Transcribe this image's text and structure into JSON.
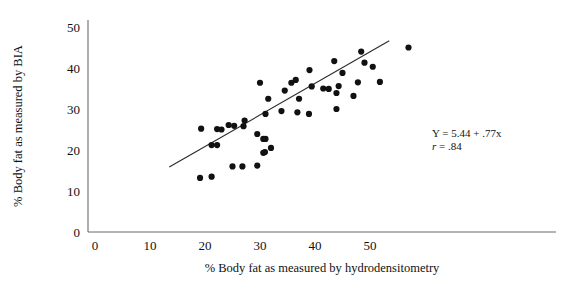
{
  "chart_data": {
    "type": "scatter",
    "title": "",
    "xlabel": "% Body fat as measured by hydrodensitometry",
    "ylabel": "% Body fat as measured by BIA",
    "xlim": [
      0,
      58
    ],
    "ylim": [
      0,
      54
    ],
    "xticks": [
      0,
      10,
      20,
      30,
      40,
      50
    ],
    "yticks": [
      0,
      10,
      20,
      30,
      40,
      50
    ],
    "xticklabels": [
      "0",
      "10",
      "20",
      "30",
      "40",
      "50"
    ],
    "yticklabels": [
      "0",
      "10",
      "20",
      "30",
      "40",
      "50"
    ],
    "grid": false,
    "legend": false,
    "marker": "filled-circle",
    "marker_color": "#111111",
    "points": [
      {
        "x": 19.1,
        "y": 13.2
      },
      {
        "x": 19.3,
        "y": 25.2
      },
      {
        "x": 21.2,
        "y": 21.2
      },
      {
        "x": 21.2,
        "y": 13.5
      },
      {
        "x": 22.2,
        "y": 25.1
      },
      {
        "x": 22.2,
        "y": 21.2
      },
      {
        "x": 23.0,
        "y": 25.0
      },
      {
        "x": 24.3,
        "y": 26.1
      },
      {
        "x": 25.0,
        "y": 16.0
      },
      {
        "x": 25.3,
        "y": 25.9
      },
      {
        "x": 26.8,
        "y": 16.0
      },
      {
        "x": 27.0,
        "y": 25.8
      },
      {
        "x": 29.5,
        "y": 23.9
      },
      {
        "x": 29.5,
        "y": 16.2
      },
      {
        "x": 30.6,
        "y": 22.7
      },
      {
        "x": 31.0,
        "y": 22.7
      },
      {
        "x": 30.6,
        "y": 19.3
      },
      {
        "x": 30.9,
        "y": 19.5
      },
      {
        "x": 36.8,
        "y": 29.2
      },
      {
        "x": 31.0,
        "y": 28.8
      },
      {
        "x": 32.0,
        "y": 20.5
      },
      {
        "x": 39.0,
        "y": 39.5
      },
      {
        "x": 37.1,
        "y": 32.5
      },
      {
        "x": 38.9,
        "y": 28.8
      },
      {
        "x": 30.0,
        "y": 36.4
      },
      {
        "x": 31.5,
        "y": 32.5
      },
      {
        "x": 33.9,
        "y": 29.5
      },
      {
        "x": 43.9,
        "y": 30.0
      },
      {
        "x": 44.3,
        "y": 35.6
      },
      {
        "x": 45.0,
        "y": 38.8
      },
      {
        "x": 43.5,
        "y": 41.7
      },
      {
        "x": 47.0,
        "y": 33.2
      },
      {
        "x": 47.8,
        "y": 36.5
      },
      {
        "x": 48.4,
        "y": 44.0
      },
      {
        "x": 49.0,
        "y": 41.3
      },
      {
        "x": 50.5,
        "y": 40.3
      },
      {
        "x": 51.8,
        "y": 36.6
      },
      {
        "x": 39.4,
        "y": 35.5
      },
      {
        "x": 41.5,
        "y": 35.0
      },
      {
        "x": 35.7,
        "y": 36.4
      },
      {
        "x": 36.5,
        "y": 37.1
      },
      {
        "x": 34.5,
        "y": 34.5
      },
      {
        "x": 42.5,
        "y": 34.9
      },
      {
        "x": 43.9,
        "y": 33.9
      },
      {
        "x": 27.2,
        "y": 27.2
      },
      {
        "x": 57.0,
        "y": 45.0
      }
    ],
    "regression": {
      "equation_label": "Y = 5.44 + .77x",
      "correlation_label": "r = .84",
      "intercept": 5.44,
      "slope": 0.77,
      "r": 0.84,
      "x_start": 13.5,
      "x_end": 53.5
    }
  },
  "annotation": {
    "line1": "Y = 5.44 + .77x",
    "line2_italic": "r",
    "line2_rest": " = .84"
  }
}
